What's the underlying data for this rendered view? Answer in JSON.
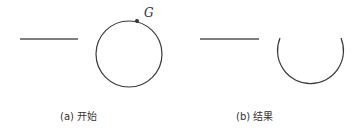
{
  "panels": [
    {
      "id": "a",
      "caption": "(a) 开始",
      "point_label": "G"
    },
    {
      "id": "b",
      "caption": "(b) 结果"
    }
  ],
  "colors": {
    "stroke": "#3a3a3a",
    "background": "#ffffff"
  }
}
